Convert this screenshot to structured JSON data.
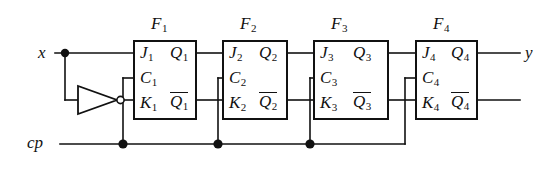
{
  "diagram": {
    "colors": {
      "wire": "#111111",
      "box_border": "#111111",
      "background": "#ffffff"
    },
    "io": {
      "input_label": "x",
      "clock_label": "cp",
      "output_label": "y"
    },
    "inverter": {
      "name": "inverter",
      "input_from": "x",
      "output_to": "K1"
    },
    "flipflops": [
      {
        "title": "F",
        "index": "1",
        "inputs": {
          "j": "J",
          "c": "C",
          "k": "K"
        },
        "outputs": {
          "q": "Q",
          "qbar": "Q"
        },
        "subscript": "1"
      },
      {
        "title": "F",
        "index": "2",
        "inputs": {
          "j": "J",
          "c": "C",
          "k": "K"
        },
        "outputs": {
          "q": "Q",
          "qbar": "Q"
        },
        "subscript": "2"
      },
      {
        "title": "F",
        "index": "3",
        "inputs": {
          "j": "J",
          "c": "C",
          "k": "K"
        },
        "outputs": {
          "q": "Q",
          "qbar": "Q"
        },
        "subscript": "3"
      },
      {
        "title": "F",
        "index": "4",
        "inputs": {
          "j": "J",
          "c": "C",
          "k": "K"
        },
        "outputs": {
          "q": "Q",
          "qbar": "Q"
        },
        "subscript": "4"
      }
    ]
  }
}
